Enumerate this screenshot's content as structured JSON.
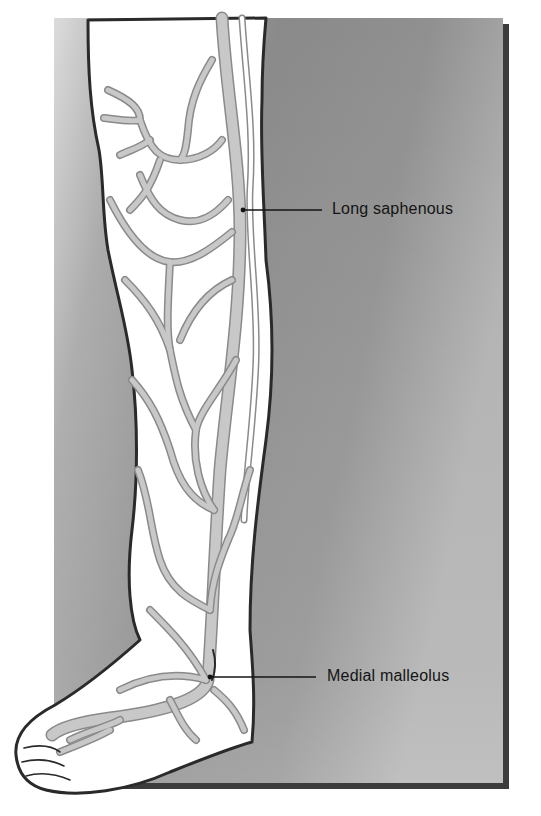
{
  "figure": {
    "colors": {
      "background": "#ffffff",
      "panel_light": "#d8d8d8",
      "panel_mid": "#9a9a9a",
      "panel_dark": "#7e7e7e",
      "panel_shadow": "#3c3c3c",
      "skin": "#ffffff",
      "vein_fill": "#c8c8c8",
      "vein_edge": "#8a8a8a",
      "outline": "#2a2a2a",
      "label_text": "#141414"
    },
    "labels": [
      {
        "id": "long-saphenous",
        "text": "Long saphenous"
      },
      {
        "id": "medial-malleolus",
        "text": "Medial malleolus"
      }
    ]
  }
}
